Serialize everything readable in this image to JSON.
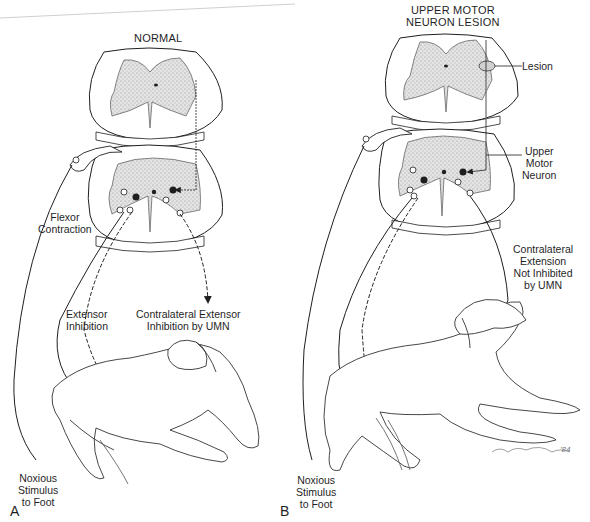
{
  "figure": {
    "panels": [
      {
        "letter": "A",
        "title": "NORMAL",
        "labels": {
          "flexor": [
            "Flexor",
            "Contraction"
          ],
          "extensor_inhibition": [
            "Extensor",
            "Inhibition"
          ],
          "contralateral": [
            "Contralateral Extensor",
            "Inhibition by UMN"
          ],
          "stimulus": [
            "Noxious",
            "Stimulus",
            "to Foot"
          ]
        }
      },
      {
        "letter": "B",
        "title": [
          "UPPER MOTOR",
          "NEURON LESION"
        ],
        "labels": {
          "lesion": "Lesion",
          "umn": [
            "Upper",
            "Motor",
            "Neuron"
          ],
          "contralateral": [
            "Contralateral",
            "Extension",
            "Not Inhibited",
            "by UMN"
          ],
          "stimulus": [
            "Noxious",
            "Stimulus",
            "to Foot"
          ]
        }
      }
    ],
    "signature": "'84",
    "colors": {
      "ink": "#1f1f1f",
      "gray_matter": "#d9d9d9",
      "background": "#ffffff"
    }
  }
}
